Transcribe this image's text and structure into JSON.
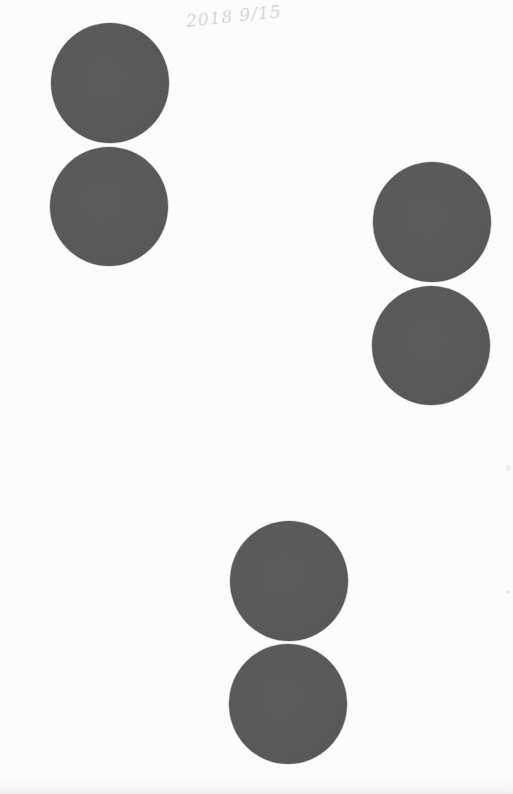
{
  "page": {
    "background": "#fcfcfc",
    "handwritten_note": "2018 9/15",
    "dot_color": "#5a5a5a"
  },
  "dots": [
    {
      "group": "top-left",
      "position": "upper",
      "left": 51,
      "top": 23,
      "width": 118,
      "height": 120
    },
    {
      "group": "top-left",
      "position": "lower",
      "left": 50,
      "top": 147,
      "width": 118,
      "height": 119
    },
    {
      "group": "right",
      "position": "upper",
      "left": 373,
      "top": 162,
      "width": 118,
      "height": 120
    },
    {
      "group": "right",
      "position": "lower",
      "left": 372,
      "top": 286,
      "width": 118,
      "height": 119
    },
    {
      "group": "bottom-center",
      "position": "upper",
      "left": 230,
      "top": 521,
      "width": 118,
      "height": 120
    },
    {
      "group": "bottom-center",
      "position": "lower",
      "left": 229,
      "top": 644,
      "width": 118,
      "height": 120
    }
  ]
}
